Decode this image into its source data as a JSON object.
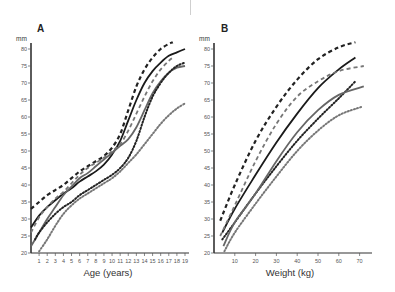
{
  "figure": {
    "panel_a_label": "A",
    "panel_b_label": "B",
    "unit_label": "mm"
  },
  "chart_data": [
    {
      "type": "line",
      "panel": "A",
      "title": "A",
      "xlabel": "Age (years)",
      "ylabel": "mm",
      "xlim": [
        0,
        19
      ],
      "ylim": [
        20,
        80
      ],
      "xticks": [
        1,
        2,
        3,
        4,
        5,
        6,
        7,
        8,
        9,
        10,
        11,
        12,
        13,
        14,
        15,
        16,
        17,
        18,
        19
      ],
      "yticks": [
        20,
        25,
        30,
        35,
        40,
        45,
        50,
        55,
        60,
        65,
        70,
        75,
        80
      ],
      "grid": false,
      "legend": null,
      "series": [
        {
          "name": "black-dashed",
          "color": "#222222",
          "style": "dashed",
          "width": 2.2,
          "x": [
            0,
            1,
            2,
            3,
            4,
            5,
            6,
            7,
            8,
            9,
            10,
            11,
            12,
            13,
            14,
            15,
            16,
            17,
            17.5
          ],
          "y": [
            33,
            35,
            37,
            38.5,
            40,
            42,
            44,
            45.5,
            47,
            48.5,
            51,
            55,
            62,
            69,
            74,
            77.5,
            80,
            81.5,
            82
          ]
        },
        {
          "name": "black-solid",
          "color": "#1a1a1a",
          "style": "solid",
          "width": 1.8,
          "x": [
            0,
            1,
            2,
            3,
            4,
            5,
            6,
            7,
            8,
            9,
            10,
            11,
            12,
            13,
            14,
            15,
            16,
            17,
            18,
            19
          ],
          "y": [
            27.5,
            31,
            33.5,
            35.5,
            37.5,
            39,
            41,
            42.5,
            44,
            46,
            49,
            53,
            59,
            65,
            70,
            73.5,
            76,
            78,
            79,
            80
          ]
        },
        {
          "name": "gray-dashed",
          "color": "#777777",
          "style": "dashed",
          "width": 1.8,
          "x": [
            0,
            1,
            2,
            3,
            4,
            5,
            6,
            7,
            8,
            9,
            10,
            11,
            12,
            13,
            14,
            15,
            16,
            17,
            17.5
          ],
          "y": [
            26,
            30.5,
            33.5,
            36,
            38,
            40.5,
            43,
            45,
            46.5,
            48,
            50,
            52,
            56,
            61,
            66,
            70.5,
            74,
            76.5,
            77.5
          ]
        },
        {
          "name": "gray-solid",
          "color": "#666666",
          "style": "solid",
          "width": 1.8,
          "x": [
            0,
            1,
            2,
            3,
            4,
            5,
            6,
            7,
            8,
            9,
            10,
            11,
            12,
            13,
            14,
            15,
            16,
            17,
            18,
            19
          ],
          "y": [
            22,
            26,
            30,
            33.5,
            37,
            39.5,
            42,
            43.5,
            45.5,
            47.5,
            49.5,
            51.5,
            53.5,
            57,
            62,
            67,
            70.5,
            73,
            74.5,
            75
          ]
        },
        {
          "name": "black-dotted",
          "color": "#222222",
          "style": "dotted",
          "width": 2,
          "x": [
            0.5,
            1,
            2,
            3,
            4,
            5,
            6,
            7,
            8,
            9,
            10,
            11,
            12,
            13,
            14,
            15,
            16,
            17,
            18,
            19
          ],
          "y": [
            24,
            26,
            29,
            31.5,
            33.5,
            35,
            37,
            38.5,
            40,
            41.5,
            43,
            45,
            48,
            53,
            60,
            66,
            70,
            73,
            75,
            76
          ]
        },
        {
          "name": "gray-dotted",
          "color": "#777777",
          "style": "dotted",
          "width": 2,
          "x": [
            1,
            2,
            3,
            4,
            5,
            6,
            7,
            8,
            9,
            10,
            11,
            12,
            13,
            14,
            15,
            16,
            17,
            18,
            19
          ],
          "y": [
            20.5,
            24,
            28,
            31.5,
            34,
            36,
            37.5,
            39,
            40.5,
            42,
            44,
            46.5,
            49,
            52,
            55,
            58,
            60.5,
            62.5,
            64
          ]
        }
      ]
    },
    {
      "type": "line",
      "panel": "B",
      "title": "B",
      "xlabel": "Weight (kg)",
      "ylabel": "mm",
      "xlim": [
        0,
        75
      ],
      "ylim": [
        20,
        80
      ],
      "xticks": [
        10,
        20,
        30,
        40,
        50,
        60,
        70
      ],
      "yticks": [
        20,
        25,
        30,
        35,
        40,
        45,
        50,
        55,
        60,
        65,
        70,
        75,
        80
      ],
      "grid": false,
      "legend": null,
      "series": [
        {
          "name": "black-dashed",
          "color": "#222222",
          "style": "dashed",
          "width": 2.2,
          "x": [
            3,
            10,
            20,
            30,
            40,
            50,
            60,
            68
          ],
          "y": [
            29.5,
            40,
            53,
            63,
            71,
            77,
            80.5,
            82
          ]
        },
        {
          "name": "black-solid",
          "color": "#1a1a1a",
          "style": "solid",
          "width": 1.8,
          "x": [
            4,
            10,
            20,
            30,
            40,
            50,
            60,
            68
          ],
          "y": [
            26,
            33,
            43,
            52.5,
            61,
            68.5,
            74,
            77.5
          ]
        },
        {
          "name": "gray-dashed",
          "color": "#777777",
          "style": "dashed",
          "width": 1.8,
          "x": [
            3,
            10,
            20,
            30,
            40,
            50,
            60,
            72
          ],
          "y": [
            25,
            34,
            47,
            58,
            66,
            70.5,
            73.5,
            75
          ]
        },
        {
          "name": "black-dotted",
          "color": "#222222",
          "style": "dotted",
          "width": 2,
          "x": [
            4,
            10,
            20,
            30,
            40,
            50,
            60,
            68
          ],
          "y": [
            24,
            29,
            37.5,
            45.5,
            53,
            59.5,
            65.5,
            70.5
          ]
        },
        {
          "name": "gray-solid",
          "color": "#666666",
          "style": "solid",
          "width": 1.8,
          "x": [
            4.5,
            10,
            20,
            30,
            40,
            50,
            60,
            72
          ],
          "y": [
            22,
            29,
            37.5,
            47,
            55.5,
            62,
            66.5,
            69
          ]
        },
        {
          "name": "gray-dotted",
          "color": "#777777",
          "style": "dotted",
          "width": 2,
          "x": [
            5,
            10,
            20,
            30,
            40,
            50,
            60,
            71
          ],
          "y": [
            20.5,
            26,
            34.5,
            42.5,
            50,
            56,
            60.5,
            63
          ]
        }
      ]
    }
  ]
}
